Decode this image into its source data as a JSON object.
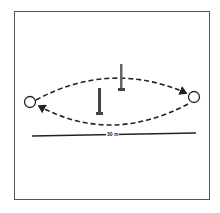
{
  "diagram": {
    "distance_label": "30 m",
    "elements": [
      {
        "type": "cone-marker",
        "position": "left"
      },
      {
        "type": "cone-marker",
        "position": "right"
      },
      {
        "type": "pole",
        "position": "center-left-low"
      },
      {
        "type": "pole",
        "position": "center-right-high"
      },
      {
        "type": "dashed-arrow-path",
        "direction": "left-to-right (upper arc)"
      },
      {
        "type": "dashed-arrow-path",
        "direction": "right-to-left (lower arc)"
      },
      {
        "type": "measurement-line",
        "label": "30 m"
      }
    ],
    "colors": {
      "line": "#222222",
      "frame": "#555555",
      "background": "#ffffff"
    }
  }
}
